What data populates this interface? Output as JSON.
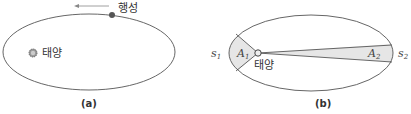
{
  "panel_a": {
    "caption": "(a)",
    "planet_label": "행성",
    "sun_label": "태양",
    "orbit": {
      "cx": 89,
      "cy": 52,
      "rx": 86,
      "ry": 38
    },
    "sun": {
      "x": 33,
      "y": 53
    },
    "planet": {
      "x": 112,
      "y": 15
    },
    "arrow_direction": "left"
  },
  "panel_b": {
    "caption": "(b)",
    "sun_label": "태양",
    "area1_label": "A",
    "area1_sub": "1",
    "area2_label": "A",
    "area2_sub": "2",
    "s1_label": "s",
    "s1_sub": "1",
    "s2_label": "s",
    "s2_sub": "2",
    "orbit": {
      "cx": 311,
      "cy": 53,
      "rx": 82,
      "ry": 38
    },
    "sun": {
      "x": 258,
      "y": 53
    }
  },
  "colors": {
    "orbit_stroke": "#555555",
    "sun_fill": "#888888",
    "planet_fill": "#555555",
    "wedge_fill": "#e6e6e6",
    "text": "#333333"
  }
}
